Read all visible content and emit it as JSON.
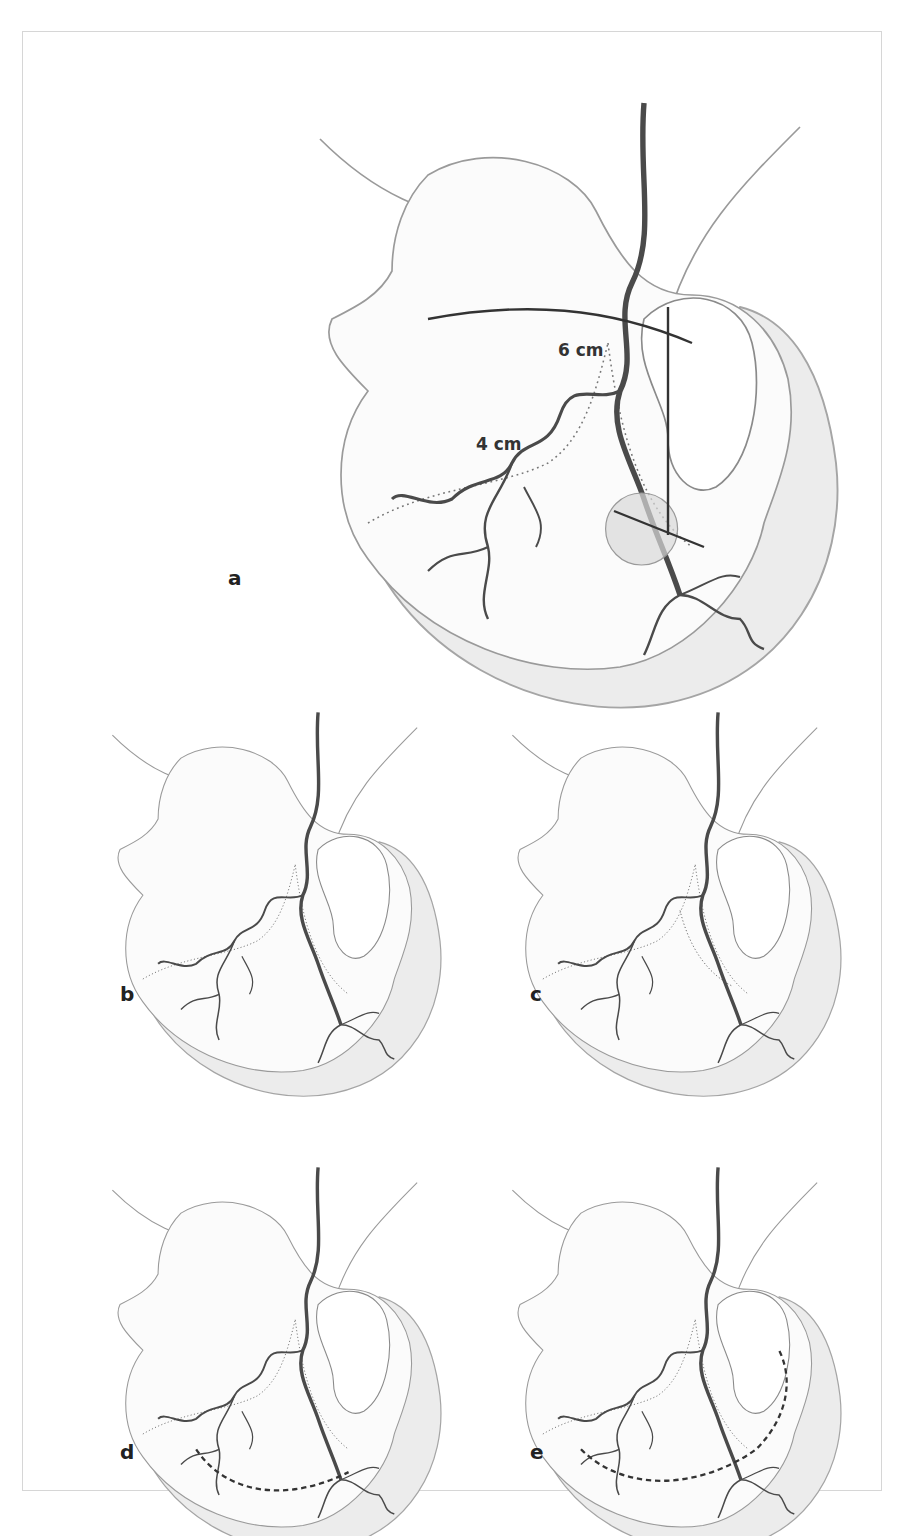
{
  "figure": {
    "panels": [
      {
        "id": "a",
        "label": "a",
        "measurements": [
          "6 cm",
          "4 cm"
        ]
      },
      {
        "id": "b",
        "label": "b"
      },
      {
        "id": "c",
        "label": "c"
      },
      {
        "id": "d",
        "label": "d"
      },
      {
        "id": "e",
        "label": "e"
      }
    ],
    "colors": {
      "outline": "#9a9a9a",
      "shade": "#ececec",
      "vessel": "#4a4a4a",
      "border": "#d9d9d9"
    }
  }
}
